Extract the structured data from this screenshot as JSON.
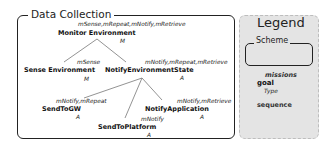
{
  "scheme": {
    "title": "Data Collection",
    "nodes": [
      {
        "id": "monitor",
        "label": "Monitor Environment",
        "missions": "mSense,mRepeat,mNotify,mRetrieve",
        "type": "M"
      },
      {
        "id": "sense",
        "label": "Sense Environment",
        "missions": "mSense",
        "type": "M"
      },
      {
        "id": "notify_state",
        "label": "NotifyEnvironmentState",
        "missions": "mNotify,mRepeat,mRetrieve",
        "type": "A"
      },
      {
        "id": "send_gw",
        "label": "SendToGW",
        "missions": "mNotify,mRepeat",
        "type": "A"
      },
      {
        "id": "send_platform",
        "label": "SendToPlatform",
        "missions": "mNotify",
        "type": "A"
      },
      {
        "id": "notify_app",
        "label": "NotifyApplication",
        "missions": "mNotify,mRetrieve",
        "type": "A"
      }
    ],
    "edges": [
      {
        "from": "monitor",
        "to": "sense"
      },
      {
        "from": "monitor",
        "to": "notify_state"
      },
      {
        "from": "notify_state",
        "to": "send_gw"
      },
      {
        "from": "notify_state",
        "to": "send_platform"
      },
      {
        "from": "notify_state",
        "to": "notify_app"
      }
    ]
  },
  "legend": {
    "title": "Legend",
    "scheme_label": "Scheme",
    "missions_label": "missions",
    "goal_label": "goal",
    "type_label": "Type",
    "sequence_label": "sequence"
  },
  "colors": {
    "legend_background": "#e4e4e4",
    "border": "#222222",
    "text": "#111111"
  }
}
